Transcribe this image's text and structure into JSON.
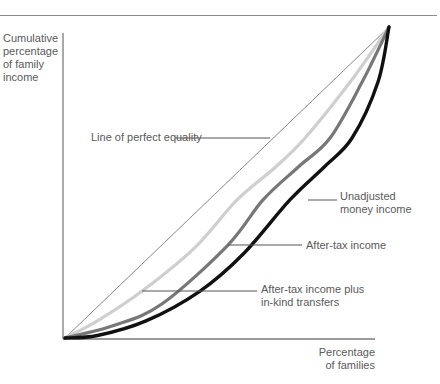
{
  "chart_data": {
    "type": "line",
    "title": "",
    "xlabel": "Percentage of families",
    "ylabel": "Cumulative percentage of family income",
    "xlim": [
      0,
      100
    ],
    "ylim": [
      0,
      100
    ],
    "grid": false,
    "legend": "inline annotations with leader lines",
    "series": [
      {
        "name": "Line of perfect equality",
        "color": "#888888",
        "x": [
          0,
          100
        ],
        "y": [
          0,
          100
        ]
      },
      {
        "name": "After-tax income plus in-kind transfers",
        "color": "#cfcfcf",
        "x": [
          0,
          10,
          23.8,
          40,
          53.1,
          65,
          74.1,
          88,
          100
        ],
        "y": [
          0,
          5.5,
          15.1,
          29,
          44.4,
          55,
          64.3,
          82.3,
          100
        ]
      },
      {
        "name": "After-tax income",
        "color": "#777777",
        "x": [
          0,
          15,
          30,
          50.3,
          61.1,
          72,
          81.8,
          91.7,
          100
        ],
        "y": [
          0,
          4,
          11,
          29.9,
          44.4,
          55,
          64.3,
          82.3,
          100
        ]
      },
      {
        "name": "Unadjusted money income",
        "color": "#111111",
        "x": [
          0,
          10,
          25,
          41.7,
          55,
          69.4,
          80,
          88.6,
          96.6,
          100
        ],
        "y": [
          0,
          0.8,
          5.5,
          15.1,
          27,
          44.4,
          55,
          64.3,
          82.3,
          100
        ]
      }
    ]
  },
  "labels": {
    "ylabel_lines": [
      "Cumulative",
      "percentage",
      "of family",
      "income"
    ],
    "xlabel_lines": [
      "Percentage",
      "of families"
    ],
    "perfect_equality": "Line of perfect equality",
    "unadjusted_line1": "Unadjusted",
    "unadjusted_line2": "money income",
    "after_tax": "After-tax income",
    "in_kind_line1": "After-tax income plus",
    "in_kind_line2": "in-kind transfers"
  }
}
